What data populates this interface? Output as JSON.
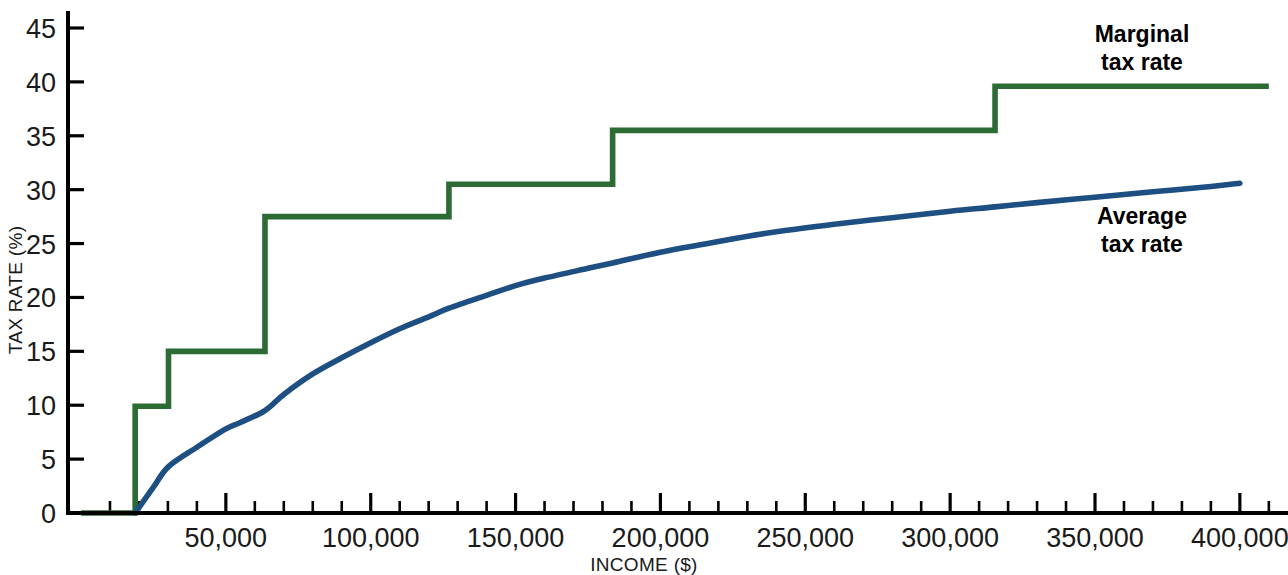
{
  "chart_data": {
    "type": "line",
    "title": "",
    "xlabel": "INCOME ($)",
    "ylabel": "TAX RATE (%)",
    "xlim": [
      0,
      410000
    ],
    "ylim": [
      0,
      46
    ],
    "grid": false,
    "legend_position": "inline-right",
    "x_ticks": [
      {
        "value": 50000,
        "label": "50,000"
      },
      {
        "value": 100000,
        "label": "100,000"
      },
      {
        "value": 150000,
        "label": "150,000"
      },
      {
        "value": 200000,
        "label": "200,000"
      },
      {
        "value": 250000,
        "label": "250,000"
      },
      {
        "value": 300000,
        "label": "300,000"
      },
      {
        "value": 350000,
        "label": "350,000"
      },
      {
        "value": 400000,
        "label": "400,000"
      }
    ],
    "x_minor_tick_interval": 10000,
    "y_ticks": [
      {
        "value": 0,
        "label": "0"
      },
      {
        "value": 5,
        "label": "5"
      },
      {
        "value": 10,
        "label": "10"
      },
      {
        "value": 15,
        "label": "15"
      },
      {
        "value": 20,
        "label": "20"
      },
      {
        "value": 25,
        "label": "25"
      },
      {
        "value": 30,
        "label": "30"
      },
      {
        "value": 35,
        "label": "35"
      },
      {
        "value": 40,
        "label": "40"
      },
      {
        "value": 45,
        "label": "45"
      }
    ],
    "series": [
      {
        "name": "Marginal tax rate",
        "label_line1": "Marginal",
        "label_line2": "tax rate",
        "color": "#2d6b34",
        "type": "step",
        "steps": [
          {
            "x_start": 0,
            "x_end": 18700,
            "rate": 0
          },
          {
            "x_start": 18700,
            "x_end": 30200,
            "rate": 9.9
          },
          {
            "x_start": 30200,
            "x_end": 63500,
            "rate": 15.0
          },
          {
            "x_start": 63500,
            "x_end": 127000,
            "rate": 27.5
          },
          {
            "x_start": 127000,
            "x_end": 183500,
            "rate": 30.5
          },
          {
            "x_start": 183500,
            "x_end": 315500,
            "rate": 35.5
          },
          {
            "x_start": 315500,
            "x_end": 410000,
            "rate": 39.6
          }
        ]
      },
      {
        "name": "Average tax rate",
        "label_line1": "Average",
        "label_line2": "tax rate",
        "color": "#1d4f82",
        "type": "curve",
        "points": [
          {
            "x": 18700,
            "y": 0.0
          },
          {
            "x": 25000,
            "y": 2.4
          },
          {
            "x": 30200,
            "y": 4.3
          },
          {
            "x": 40000,
            "y": 6.1
          },
          {
            "x": 50000,
            "y": 7.8
          },
          {
            "x": 55000,
            "y": 8.4
          },
          {
            "x": 63500,
            "y": 9.5
          },
          {
            "x": 70000,
            "y": 11.0
          },
          {
            "x": 80000,
            "y": 12.9
          },
          {
            "x": 90000,
            "y": 14.4
          },
          {
            "x": 100000,
            "y": 15.8
          },
          {
            "x": 110000,
            "y": 17.1
          },
          {
            "x": 120000,
            "y": 18.2
          },
          {
            "x": 127000,
            "y": 19.0
          },
          {
            "x": 140000,
            "y": 20.2
          },
          {
            "x": 150000,
            "y": 21.1
          },
          {
            "x": 160000,
            "y": 21.8
          },
          {
            "x": 175000,
            "y": 22.7
          },
          {
            "x": 183500,
            "y": 23.2
          },
          {
            "x": 200000,
            "y": 24.2
          },
          {
            "x": 220000,
            "y": 25.2
          },
          {
            "x": 240000,
            "y": 26.1
          },
          {
            "x": 260000,
            "y": 26.8
          },
          {
            "x": 280000,
            "y": 27.4
          },
          {
            "x": 300000,
            "y": 28.0
          },
          {
            "x": 315500,
            "y": 28.4
          },
          {
            "x": 330000,
            "y": 28.8
          },
          {
            "x": 350000,
            "y": 29.3
          },
          {
            "x": 370000,
            "y": 29.8
          },
          {
            "x": 390000,
            "y": 30.3
          },
          {
            "x": 400000,
            "y": 30.6
          }
        ]
      }
    ]
  }
}
